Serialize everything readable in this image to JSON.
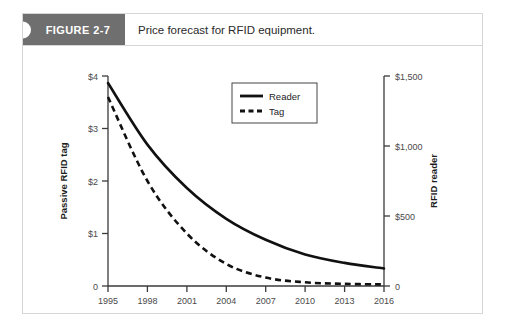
{
  "figure": {
    "tag_label": "FIGURE 2-7",
    "caption": "Price forecast for RFID equipment."
  },
  "chart_data": {
    "type": "line",
    "title": "Price forecast for RFID equipment.",
    "xlabel": "",
    "ylabel": "Passive RFID tag",
    "y2label": "RFID reader",
    "grid": false,
    "legend_position": "top-right",
    "x": [
      1995,
      1998,
      2001,
      2004,
      2007,
      2010,
      2013,
      2016
    ],
    "xlim": [
      1995,
      2016
    ],
    "xticklabels": [
      "1995",
      "1998",
      "2001",
      "2004",
      "2007",
      "2010",
      "2013",
      "2016"
    ],
    "ylim": [
      0,
      4
    ],
    "yticks": [
      0,
      1,
      2,
      3,
      4
    ],
    "yticklabels": [
      "0",
      "$1",
      "$2",
      "$3",
      "$4"
    ],
    "y2lim": [
      0,
      1500
    ],
    "y2ticks": [
      0,
      500,
      1000,
      1500
    ],
    "y2ticklabels": [
      "0",
      "$500",
      "$1,000",
      "$1,500"
    ],
    "series": [
      {
        "name": "Reader",
        "style": "solid",
        "axis": "right",
        "units": "USD",
        "x": [
          1995,
          1998,
          2001,
          2004,
          2007,
          2010,
          2013,
          2016
        ],
        "values": [
          1450,
          1010,
          700,
          480,
          330,
          225,
          165,
          125
        ],
        "values_left_scale": [
          3.87,
          2.69,
          1.87,
          1.28,
          0.88,
          0.6,
          0.44,
          0.33
        ]
      },
      {
        "name": "Tag",
        "style": "dashed",
        "axis": "left",
        "units": "USD",
        "x": [
          1995,
          1998,
          2001,
          2004,
          2007,
          2010,
          2013,
          2016
        ],
        "values": [
          3.6,
          2.0,
          1.0,
          0.42,
          0.16,
          0.07,
          0.04,
          0.03
        ]
      }
    ],
    "legend": [
      "Reader",
      "Tag"
    ],
    "colors": {
      "line": "#111111",
      "axis": "#3a3a3a",
      "tick_text": "#4a4a4a",
      "card_border": "#d6d6d6",
      "tab_background": "#6f6f6f",
      "tab_text": "#ffffff",
      "background": "#ffffff"
    }
  }
}
